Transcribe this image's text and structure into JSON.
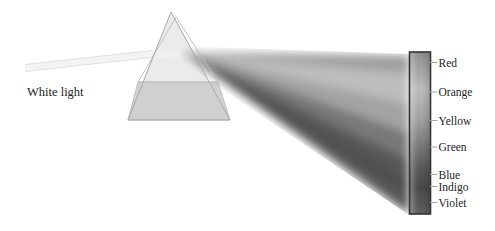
{
  "figure": {
    "background": "#ffffff",
    "source_label": "White light",
    "label_color": "#242424",
    "beam": {
      "fill": "#f3f3f3",
      "edge": "#e0e0e0"
    },
    "prism": {
      "face": "#e7e7e7",
      "base_face": "#cfcfcf",
      "edge": "#a8a8a8",
      "back_edge": "#bdbdbd",
      "inner_beam": "#f0f0f0"
    },
    "screen_bar": {
      "outline": "#333333",
      "top_gray": "#8c8c8c",
      "bottom_gray": "#5f5f5f",
      "tick_color": "#a6a6a6"
    },
    "spectrum": [
      {
        "label": "Red",
        "gray": "#9e9e9e",
        "tick_y": 62.5,
        "band_top": 55,
        "band_bottom": 74
      },
      {
        "label": "Orange",
        "gray": "#bdbdbd",
        "tick_y": 92,
        "band_top": 74,
        "band_bottom": 104
      },
      {
        "label": "Yellow",
        "gray": "#a3a3a3",
        "tick_y": 120.5,
        "band_top": 104,
        "band_bottom": 133
      },
      {
        "label": "Green",
        "gray": "#787878",
        "tick_y": 147,
        "band_top": 133,
        "band_bottom": 160
      },
      {
        "label": "Blue",
        "gray": "#565656",
        "tick_y": 174.5,
        "band_top": 160,
        "band_bottom": 181
      },
      {
        "label": "Indigo",
        "gray": "#4a4a4a",
        "tick_y": 186.5,
        "band_top": 181,
        "band_bottom": 195
      },
      {
        "label": "Violet",
        "gray": "#575757",
        "tick_y": 202.5,
        "band_top": 195,
        "band_bottom": 214
      }
    ]
  }
}
